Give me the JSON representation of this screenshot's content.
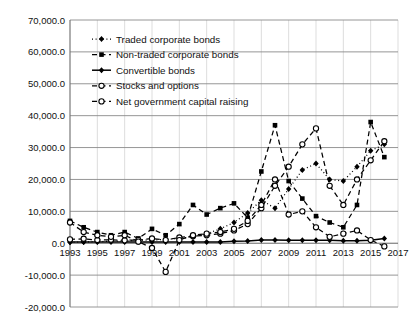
{
  "chart_data": {
    "type": "line",
    "title": "",
    "xlabel": "",
    "ylabel": "",
    "grid": "horizontal-gridlines-and-faint-vertical-gridlines",
    "legend_position": "upper-left-inside-plot",
    "ylim": [
      -20000,
      70000
    ],
    "ytick_step": 10000,
    "ytick_labels": [
      "70,000.0",
      "60,000.0",
      "50,000.0",
      "40,000.0",
      "30,000.0",
      "20,000.0",
      "10,000.0",
      "0.0",
      "-10,000.0",
      "-20,000.0"
    ],
    "ytick_values": [
      70000,
      60000,
      50000,
      40000,
      30000,
      20000,
      10000,
      0,
      -10000,
      -20000
    ],
    "xlim": [
      1993,
      2017
    ],
    "xtick_labels": [
      "1993",
      "1995",
      "1997",
      "1999",
      "2001",
      "2003",
      "2005",
      "2007",
      "2009",
      "2011",
      "2013",
      "2015",
      "2017"
    ],
    "xtick_values": [
      1993,
      1995,
      1997,
      1999,
      2001,
      2003,
      2005,
      2007,
      2009,
      2011,
      2013,
      2015,
      2017
    ],
    "x": [
      1993,
      1994,
      1995,
      1996,
      1997,
      1998,
      1999,
      2000,
      2001,
      2002,
      2003,
      2004,
      2005,
      2006,
      2007,
      2008,
      2009,
      2010,
      2011,
      2012,
      2013,
      2014,
      2015,
      2016
    ],
    "series": [
      {
        "name": "Traded corporate bonds",
        "marker": "diamond-filled",
        "linestyle": "dotted",
        "color": "#000000",
        "values": [
          300,
          400,
          500,
          600,
          700,
          900,
          1000,
          1200,
          1500,
          2000,
          3000,
          4500,
          6500,
          9500,
          13500,
          11000,
          17000,
          23000,
          25000,
          20000,
          19500,
          24000,
          29000,
          31000
        ]
      },
      {
        "name": "Non-traded corporate bonds",
        "marker": "square-filled",
        "linestyle": "dashed",
        "color": "#000000",
        "values": [
          7000,
          5000,
          3500,
          2500,
          3500,
          1500,
          4500,
          2500,
          6000,
          12000,
          9000,
          11000,
          12500,
          8000,
          22500,
          37000,
          19500,
          14000,
          8500,
          6500,
          5000,
          12000,
          38000,
          27000
        ]
      },
      {
        "name": "Convertible bonds",
        "marker": "diamond-filled",
        "linestyle": "solid",
        "color": "#000000",
        "values": [
          400,
          400,
          400,
          400,
          400,
          400,
          400,
          400,
          400,
          400,
          400,
          400,
          600,
          700,
          1000,
          1000,
          900,
          900,
          900,
          900,
          800,
          800,
          900,
          1500
        ]
      },
      {
        "name": "Stocks and options",
        "marker": "circle-open",
        "linestyle": "dashed",
        "color": "#000000",
        "values": [
          1200,
          1400,
          1000,
          1100,
          900,
          1000,
          1500,
          1000,
          1800,
          2200,
          2500,
          3000,
          4000,
          6000,
          11000,
          18000,
          24000,
          31000,
          36000,
          18000,
          12000,
          20000,
          26000,
          32000
        ]
      },
      {
        "name": "Net government capital raising",
        "marker": "circle-open",
        "linestyle": "dashed",
        "color": "#000000",
        "values": [
          6500,
          3500,
          2500,
          2000,
          2500,
          500,
          -1500,
          -9000,
          1000,
          2500,
          3000,
          3500,
          4500,
          7000,
          12000,
          20000,
          9000,
          10000,
          5000,
          2000,
          3000,
          4000,
          1000,
          -1000
        ]
      }
    ]
  },
  "legend": {
    "items": [
      {
        "label": "Traded corporate bonds"
      },
      {
        "label": "Non-traded corporate bonds"
      },
      {
        "label": "Convertible bonds"
      },
      {
        "label": "Stocks and options"
      },
      {
        "label": "Net government capital raising"
      }
    ]
  }
}
